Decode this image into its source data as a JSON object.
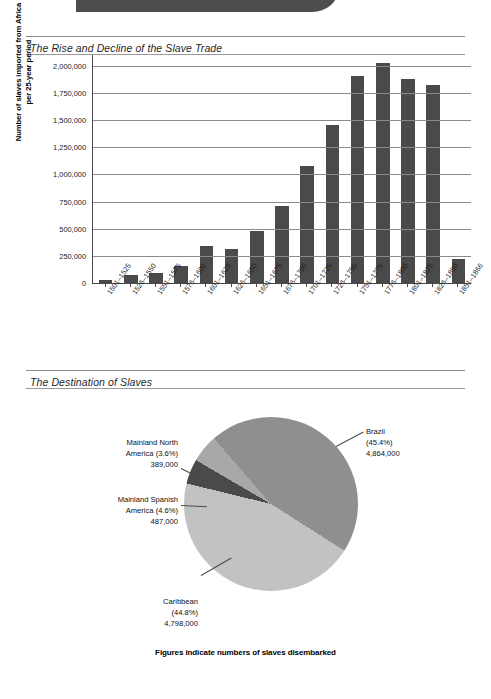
{
  "banner": {
    "label": ""
  },
  "sections": {
    "bar": {
      "title": "The Rise and Decline of the Slave Trade"
    },
    "pie": {
      "title": "The Destination of Slaves"
    }
  },
  "chart_data": [
    {
      "type": "bar",
      "title": "The Rise and Decline of the Slave Trade",
      "xlabel": "",
      "ylabel": "Number of slaves imported from Africa per 25-year period",
      "ylim": [
        0,
        2100000
      ],
      "yticks": [
        0,
        250000,
        500000,
        750000,
        1000000,
        1250000,
        1500000,
        1750000,
        2000000
      ],
      "ytick_labels": [
        "0",
        "250,000",
        "500,000",
        "750,000",
        "1,000,000",
        "1,250,000",
        "1,500,000",
        "1,750,000",
        "2,000,000"
      ],
      "grid": true,
      "legend": "none",
      "bar_color": "#4a4a4a",
      "categories": [
        "1501–1525",
        "1526–1550",
        "1551–1575",
        "1576–1600",
        "1601–1625",
        "1626–1650",
        "1651–1675",
        "1676–1700",
        "1701–1725",
        "1726–1750",
        "1751–1775",
        "1776–1800",
        "1801–1825",
        "1826–1850",
        "1851–1866"
      ],
      "values": [
        30000,
        70000,
        90000,
        160000,
        345000,
        315000,
        480000,
        710000,
        1075000,
        1460000,
        1905000,
        2025000,
        1875000,
        1825000,
        225000
      ]
    },
    {
      "type": "pie",
      "title": "The Destination of Slaves",
      "caption": "Figures indicate numbers of slaves disembarked",
      "legend": "callouts",
      "slices": [
        {
          "name": "Brazil",
          "percent": 45.4,
          "value": 4864000,
          "label_percent": "(45.4%)",
          "label_value": "4,864,000",
          "color": "#8f8f8f"
        },
        {
          "name": "Caribbean",
          "percent": 44.8,
          "value": 4798000,
          "label_percent": "(44.8%)",
          "label_value": "4,798,000",
          "color": "#c2c2c2"
        },
        {
          "name": "Mainland Spanish America",
          "percent": 4.6,
          "value": 487000,
          "label_percent": "(4.6%)",
          "label_value": "487,000",
          "color": "#4a4a4a"
        },
        {
          "name": "Mainland North America",
          "percent": 3.6,
          "value": 389000,
          "label_percent": "(3.6%)",
          "label_value": "389,000",
          "color": "#a8a8a8"
        }
      ]
    }
  ],
  "pie_callouts": {
    "north_america": {
      "line1": "Mainland North",
      "line2": "America (3.6%)",
      "line3": "389,000"
    },
    "spanish_america": {
      "line1": "Mainland Spanish",
      "line2": "America (4.6%)",
      "line3": "487,000"
    },
    "brazil": {
      "line1": "Brazil",
      "line2": "(45.4%)",
      "line3": "4,864,000"
    },
    "caribbean": {
      "line1": "Caribbean",
      "line2": "(44.8%)",
      "line3": "4,798,000"
    }
  },
  "caption": "Figures indicate numbers of slaves disembarked"
}
